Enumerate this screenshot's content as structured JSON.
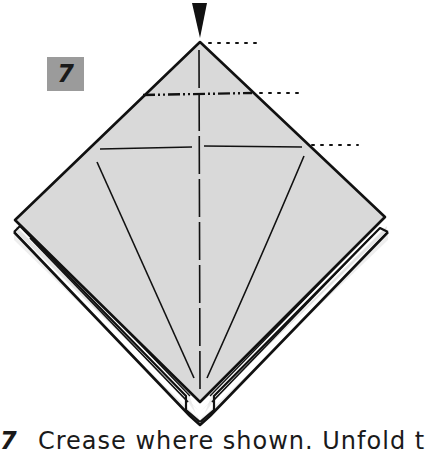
{
  "step": {
    "number": "7",
    "badge_color": "#9b9b9b"
  },
  "caption": {
    "number": "7",
    "text": "Crease where shown. Unfold t"
  },
  "diagram": {
    "paper_color": "#d9d9d9",
    "back_flap_color": "#eeeeee",
    "line_color": "#111111",
    "arrow": "push-arrow-down",
    "crease_lines": [
      {
        "type": "valley-vertical",
        "label": "center crease"
      },
      {
        "type": "mountain-dot-dash",
        "label": "upper horizontal crease"
      },
      {
        "type": "valley-horizontal",
        "label": "lower horizontal crease"
      },
      {
        "type": "diagonal-left",
        "label": "left kite crease"
      },
      {
        "type": "diagonal-right",
        "label": "right kite crease"
      }
    ],
    "reference_lines": 3
  }
}
